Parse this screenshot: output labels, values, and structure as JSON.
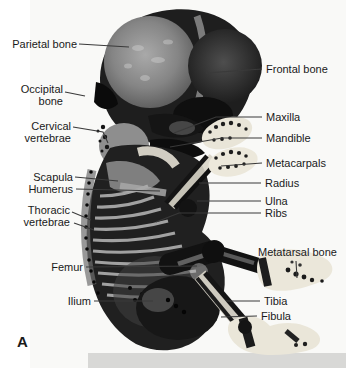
{
  "figure": {
    "panel_letter": "A",
    "labels": [
      {
        "id": "parietal-bone",
        "text": "Parietal bone",
        "side": "left",
        "anchor_x": 77,
        "anchor_y": 44,
        "lines": [
          [
            [
              79,
              44
            ],
            [
              129,
              47
            ]
          ]
        ]
      },
      {
        "id": "occipital-bone",
        "text": "Occipital\nbone",
        "side": "left",
        "anchor_x": 63,
        "anchor_y": 95,
        "lines": [
          [
            [
              65,
              92
            ],
            [
              85,
              96
            ]
          ]
        ]
      },
      {
        "id": "cervical-vertebrae",
        "text": "Cervical\nvertebrae",
        "side": "left",
        "anchor_x": 71,
        "anchor_y": 132,
        "lines": [
          [
            [
              73,
              127
            ],
            [
              103,
              132
            ],
            [
              108,
              143
            ]
          ]
        ]
      },
      {
        "id": "scapula",
        "text": "Scapula",
        "side": "left",
        "anchor_x": 73,
        "anchor_y": 177,
        "lines": [
          [
            [
              75,
              177
            ],
            [
              118,
              181
            ]
          ]
        ]
      },
      {
        "id": "humerus",
        "text": "Humerus",
        "side": "left",
        "anchor_x": 73,
        "anchor_y": 189,
        "lines": [
          [
            [
              76,
              189
            ],
            [
              160,
              191
            ]
          ]
        ]
      },
      {
        "id": "thoracic-vertebrae",
        "text": "Thoracic\nvertebrae",
        "side": "left",
        "anchor_x": 70,
        "anchor_y": 216,
        "lines": [
          [
            [
              72,
              212
            ],
            [
              91,
              220
            ]
          ],
          [
            [
              74,
              223
            ],
            [
              94,
              230
            ]
          ]
        ]
      },
      {
        "id": "femur",
        "text": "Femur",
        "side": "left",
        "anchor_x": 83,
        "anchor_y": 267,
        "lines": [
          [
            [
              86,
              267
            ],
            [
              197,
              266
            ]
          ]
        ]
      },
      {
        "id": "ilium",
        "text": "Ilium",
        "side": "left",
        "anchor_x": 91,
        "anchor_y": 301,
        "lines": [
          [
            [
              94,
              301
            ],
            [
              153,
              301
            ]
          ]
        ]
      },
      {
        "id": "frontal-bone",
        "text": "Frontal bone",
        "side": "right",
        "anchor_x": 266,
        "anchor_y": 69,
        "lines": [
          [
            [
              262,
              69
            ],
            [
              206,
              73
            ]
          ]
        ]
      },
      {
        "id": "maxilla",
        "text": "Maxilla",
        "side": "right",
        "anchor_x": 266,
        "anchor_y": 117,
        "lines": [
          [
            [
              262,
              117
            ],
            [
              216,
              117
            ],
            [
              174,
              133
            ]
          ]
        ]
      },
      {
        "id": "mandible",
        "text": "Mandible",
        "side": "right",
        "anchor_x": 266,
        "anchor_y": 138,
        "lines": [
          [
            [
              262,
              138
            ],
            [
              222,
              138
            ],
            [
              170,
              147
            ]
          ]
        ]
      },
      {
        "id": "metacarpals",
        "text": "Metacarpals",
        "side": "right",
        "anchor_x": 266,
        "anchor_y": 163,
        "lines": [
          [
            [
              262,
              163
            ],
            [
              221,
              166
            ]
          ]
        ]
      },
      {
        "id": "radius",
        "text": "Radius",
        "side": "right",
        "anchor_x": 265,
        "anchor_y": 183,
        "lines": [
          [
            [
              261,
              183
            ],
            [
              199,
              183
            ]
          ]
        ]
      },
      {
        "id": "ulna",
        "text": "Ulna",
        "side": "right",
        "anchor_x": 265,
        "anchor_y": 201,
        "lines": [
          [
            [
              261,
              201
            ],
            [
              197,
              201
            ]
          ]
        ]
      },
      {
        "id": "ribs",
        "text": "Ribs",
        "side": "right",
        "anchor_x": 265,
        "anchor_y": 213,
        "lines": [
          [
            [
              261,
              213
            ],
            [
              179,
              213
            ],
            [
              156,
              222
            ]
          ]
        ]
      },
      {
        "id": "metatarsal-bone",
        "text": "Metatarsal bone",
        "side": "right",
        "anchor_x": 258,
        "anchor_y": 252,
        "lines": [
          [
            [
              296,
              261
            ],
            [
              297,
              278
            ]
          ]
        ]
      },
      {
        "id": "tibia",
        "text": "Tibia",
        "side": "right",
        "anchor_x": 264,
        "anchor_y": 301,
        "lines": [
          [
            [
              260,
              301
            ],
            [
              226,
              301
            ]
          ]
        ]
      },
      {
        "id": "fibula",
        "text": "Fibula",
        "side": "right",
        "anchor_x": 261,
        "anchor_y": 316,
        "lines": [
          [
            [
              257,
              316
            ],
            [
              221,
              317
            ]
          ]
        ]
      }
    ]
  },
  "colors": {
    "background": "#ffffff",
    "label_text": "#1a1a1a",
    "leader_line": "#3a3a3a",
    "photo_background": "#f9f9f7",
    "photo_bottom_strip": "#d8d8d6",
    "specimen_dark": "#1c1c1c",
    "ossified_bone_light": "#eae6d9"
  }
}
